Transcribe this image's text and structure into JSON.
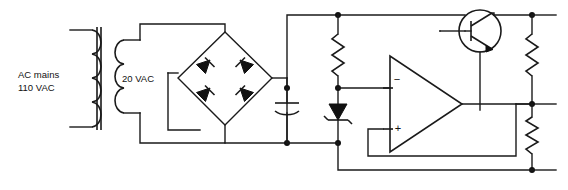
{
  "diagram": {
    "type": "circuit-schematic",
    "background_color": "#ffffff",
    "line_color": "#1a1a1a",
    "labels": {
      "source_line1": "AC mains",
      "source_line2": "110 VAC",
      "secondary": "20 VAC",
      "opamp_inverting": "−",
      "opamp_noninverting": "+"
    },
    "components": [
      {
        "id": "transformer",
        "name": "transformer",
        "label": ""
      },
      {
        "id": "bridge-rectifier",
        "name": "bridge-rectifier",
        "label": ""
      },
      {
        "id": "diode-bridge-top-left",
        "name": "diode",
        "label": ""
      },
      {
        "id": "diode-bridge-top-right",
        "name": "diode",
        "label": ""
      },
      {
        "id": "diode-bridge-bottom-left",
        "name": "diode",
        "label": ""
      },
      {
        "id": "diode-bridge-bottom-right",
        "name": "diode",
        "label": ""
      },
      {
        "id": "filter-capacitor",
        "name": "filter-capacitor",
        "label": ""
      },
      {
        "id": "bias-resistor",
        "name": "bias-resistor",
        "label": ""
      },
      {
        "id": "zener-diode",
        "name": "zener-diode",
        "label": ""
      },
      {
        "id": "op-amp",
        "name": "op-amp-error-amplifier",
        "label": ""
      },
      {
        "id": "pass-transistor",
        "name": "npn-pass-transistor",
        "label": ""
      },
      {
        "id": "divider-resistor-upper",
        "name": "feedback-resistor",
        "label": ""
      },
      {
        "id": "divider-resistor-lower",
        "name": "feedback-resistor",
        "label": ""
      }
    ]
  }
}
